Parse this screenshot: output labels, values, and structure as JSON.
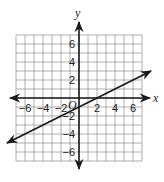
{
  "chart_data": {
    "type": "line",
    "title": "",
    "xlabel": "x",
    "ylabel": "y",
    "origin_label": "O",
    "xlim": [
      -7,
      7
    ],
    "ylim": [
      -7,
      7
    ],
    "grid": true,
    "grid_step": 1,
    "x_ticks": [
      -6,
      -4,
      -2,
      2,
      4,
      6
    ],
    "y_ticks": [
      -6,
      -4,
      -2,
      2,
      4,
      6
    ],
    "x_tick_labels": [
      "−6",
      "−4",
      "−2",
      "2",
      "4",
      "6"
    ],
    "y_tick_labels": [
      "−6",
      "−4",
      "−2",
      "2",
      "4",
      "6"
    ],
    "series": [
      {
        "name": "line",
        "equation": "y = 0.5x - 1",
        "slope": 0.5,
        "intercept": -1,
        "x": [
          -8,
          8
        ],
        "y": [
          -5,
          3
        ],
        "arrows_both_ends": true,
        "color": "#1a1a1a"
      }
    ],
    "x_intercept": 2,
    "y_intercept": -1
  },
  "colors": {
    "grid": "#9a9a9a",
    "axis": "#1a1a1a",
    "line": "#1a1a1a"
  }
}
